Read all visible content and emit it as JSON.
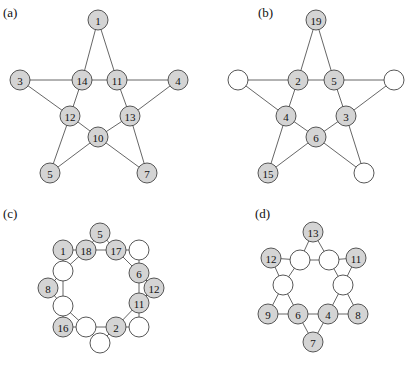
{
  "panels": [
    {
      "id": "a",
      "label": "(a)",
      "label_pos": [
        3,
        17
      ],
      "nodes": [
        {
          "id": "n1",
          "x": 98,
          "y": 20,
          "text": "1",
          "filled": true
        },
        {
          "id": "n3",
          "x": 20,
          "y": 80,
          "text": "3",
          "filled": true
        },
        {
          "id": "n14",
          "x": 82,
          "y": 80,
          "text": "14",
          "filled": true
        },
        {
          "id": "n11",
          "x": 117,
          "y": 80,
          "text": "11",
          "filled": true
        },
        {
          "id": "n4",
          "x": 178,
          "y": 80,
          "text": "4",
          "filled": true
        },
        {
          "id": "n12",
          "x": 70,
          "y": 116,
          "text": "12",
          "filled": true
        },
        {
          "id": "n13",
          "x": 130,
          "y": 116,
          "text": "13",
          "filled": true
        },
        {
          "id": "n10",
          "x": 98,
          "y": 137,
          "text": "10",
          "filled": true
        },
        {
          "id": "n5",
          "x": 50,
          "y": 173,
          "text": "5",
          "filled": true
        },
        {
          "id": "n7",
          "x": 147,
          "y": 173,
          "text": "7",
          "filled": true
        }
      ],
      "edges": [
        [
          "n1",
          "n14"
        ],
        [
          "n1",
          "n11"
        ],
        [
          "n3",
          "n14"
        ],
        [
          "n14",
          "n11"
        ],
        [
          "n11",
          "n4"
        ],
        [
          "n3",
          "n12"
        ],
        [
          "n14",
          "n12"
        ],
        [
          "n11",
          "n13"
        ],
        [
          "n4",
          "n13"
        ],
        [
          "n12",
          "n10"
        ],
        [
          "n13",
          "n10"
        ],
        [
          "n12",
          "n5"
        ],
        [
          "n13",
          "n7"
        ],
        [
          "n10",
          "n5"
        ],
        [
          "n10",
          "n7"
        ]
      ]
    },
    {
      "id": "b",
      "label": "(b)",
      "label_pos": [
        258,
        17
      ],
      "nodes": [
        {
          "id": "n19",
          "x": 316,
          "y": 20,
          "text": "19",
          "filled": true
        },
        {
          "id": "eL",
          "x": 238,
          "y": 80,
          "text": "",
          "filled": false
        },
        {
          "id": "n2",
          "x": 298,
          "y": 80,
          "text": "2",
          "filled": true
        },
        {
          "id": "n5",
          "x": 334,
          "y": 80,
          "text": "5",
          "filled": true
        },
        {
          "id": "eR",
          "x": 394,
          "y": 80,
          "text": "",
          "filled": false
        },
        {
          "id": "n4",
          "x": 286,
          "y": 116,
          "text": "4",
          "filled": true
        },
        {
          "id": "n3",
          "x": 346,
          "y": 116,
          "text": "3",
          "filled": true
        },
        {
          "id": "n6",
          "x": 316,
          "y": 137,
          "text": "6",
          "filled": true
        },
        {
          "id": "n15",
          "x": 268,
          "y": 173,
          "text": "15",
          "filled": true
        },
        {
          "id": "eB",
          "x": 364,
          "y": 173,
          "text": "",
          "filled": false
        }
      ],
      "edges": [
        [
          "n19",
          "n2"
        ],
        [
          "n19",
          "n5"
        ],
        [
          "eL",
          "n2"
        ],
        [
          "n2",
          "n5"
        ],
        [
          "n5",
          "eR"
        ],
        [
          "eL",
          "n4"
        ],
        [
          "n2",
          "n4"
        ],
        [
          "n5",
          "n3"
        ],
        [
          "eR",
          "n3"
        ],
        [
          "n4",
          "n6"
        ],
        [
          "n3",
          "n6"
        ],
        [
          "n4",
          "n15"
        ],
        [
          "n3",
          "eB"
        ],
        [
          "n6",
          "n15"
        ],
        [
          "n6",
          "eB"
        ]
      ]
    },
    {
      "id": "c",
      "label": "(c)",
      "label_pos": [
        3,
        218
      ],
      "nodes": [
        {
          "id": "n5",
          "x": 100,
          "y": 233,
          "text": "5",
          "filled": true
        },
        {
          "id": "n1",
          "x": 63,
          "y": 250,
          "text": "1",
          "filled": true
        },
        {
          "id": "n18",
          "x": 86,
          "y": 250,
          "text": "18",
          "filled": true
        },
        {
          "id": "n17",
          "x": 116,
          "y": 250,
          "text": "17",
          "filled": true
        },
        {
          "id": "eTR",
          "x": 139,
          "y": 250,
          "text": "",
          "filled": false
        },
        {
          "id": "eL1",
          "x": 63,
          "y": 271,
          "text": "",
          "filled": false
        },
        {
          "id": "n6",
          "x": 139,
          "y": 273,
          "text": "6",
          "filled": true
        },
        {
          "id": "n8",
          "x": 48,
          "y": 288,
          "text": "8",
          "filled": true
        },
        {
          "id": "n12",
          "x": 154,
          "y": 288,
          "text": "12",
          "filled": true
        },
        {
          "id": "eL2",
          "x": 63,
          "y": 306,
          "text": "",
          "filled": false
        },
        {
          "id": "n11",
          "x": 139,
          "y": 303,
          "text": "11",
          "filled": true
        },
        {
          "id": "n16",
          "x": 63,
          "y": 327,
          "text": "16",
          "filled": true
        },
        {
          "id": "eB1",
          "x": 86,
          "y": 327,
          "text": "",
          "filled": false
        },
        {
          "id": "n2",
          "x": 116,
          "y": 327,
          "text": "2",
          "filled": true
        },
        {
          "id": "eBR",
          "x": 139,
          "y": 327,
          "text": "",
          "filled": false
        },
        {
          "id": "eB2",
          "x": 100,
          "y": 343,
          "text": "",
          "filled": false
        }
      ],
      "edges": [
        [
          "n5",
          "n18"
        ],
        [
          "n5",
          "n17"
        ],
        [
          "n1",
          "n18"
        ],
        [
          "n18",
          "n17"
        ],
        [
          "n17",
          "eTR"
        ],
        [
          "n1",
          "eL1"
        ],
        [
          "n18",
          "eL1"
        ],
        [
          "n17",
          "n6"
        ],
        [
          "eTR",
          "n6"
        ],
        [
          "eL1",
          "n8"
        ],
        [
          "eL1",
          "eL2"
        ],
        [
          "n8",
          "eL2"
        ],
        [
          "n6",
          "n12"
        ],
        [
          "n6",
          "n11"
        ],
        [
          "n12",
          "n11"
        ],
        [
          "eL2",
          "n16"
        ],
        [
          "eL2",
          "eB1"
        ],
        [
          "n16",
          "eB1"
        ],
        [
          "eB1",
          "n2"
        ],
        [
          "eB1",
          "eB2"
        ],
        [
          "eB2",
          "n2"
        ],
        [
          "n11",
          "n2"
        ],
        [
          "n11",
          "eBR"
        ],
        [
          "n2",
          "eBR"
        ]
      ]
    },
    {
      "id": "d",
      "label": "(d)",
      "label_pos": [
        255,
        218
      ],
      "nodes": [
        {
          "id": "n13",
          "x": 313,
          "y": 232,
          "text": "13",
          "filled": true
        },
        {
          "id": "n12",
          "x": 271,
          "y": 258,
          "text": "12",
          "filled": true
        },
        {
          "id": "eTL",
          "x": 300,
          "y": 260,
          "text": "",
          "filled": false
        },
        {
          "id": "eTR",
          "x": 329,
          "y": 260,
          "text": "",
          "filled": false
        },
        {
          "id": "n11",
          "x": 356,
          "y": 258,
          "text": "11",
          "filled": true
        },
        {
          "id": "eML",
          "x": 283,
          "y": 285,
          "text": "",
          "filled": false
        },
        {
          "id": "eMR",
          "x": 343,
          "y": 285,
          "text": "",
          "filled": false
        },
        {
          "id": "n9",
          "x": 268,
          "y": 314,
          "text": "9",
          "filled": true
        },
        {
          "id": "n6",
          "x": 298,
          "y": 314,
          "text": "6",
          "filled": true
        },
        {
          "id": "n4",
          "x": 328,
          "y": 314,
          "text": "4",
          "filled": true
        },
        {
          "id": "n8",
          "x": 358,
          "y": 314,
          "text": "8",
          "filled": true
        },
        {
          "id": "n7",
          "x": 313,
          "y": 342,
          "text": "7",
          "filled": true
        }
      ],
      "edges": [
        [
          "n13",
          "eTL"
        ],
        [
          "n13",
          "eTR"
        ],
        [
          "n12",
          "eTL"
        ],
        [
          "eTL",
          "eTR"
        ],
        [
          "eTR",
          "n11"
        ],
        [
          "n12",
          "eML"
        ],
        [
          "eTL",
          "eML"
        ],
        [
          "eTR",
          "eMR"
        ],
        [
          "n11",
          "eMR"
        ],
        [
          "eML",
          "n9"
        ],
        [
          "eML",
          "n6"
        ],
        [
          "eMR",
          "n4"
        ],
        [
          "eMR",
          "n8"
        ],
        [
          "n9",
          "n6"
        ],
        [
          "n6",
          "n4"
        ],
        [
          "n4",
          "n8"
        ],
        [
          "n6",
          "n7"
        ],
        [
          "n4",
          "n7"
        ]
      ]
    }
  ],
  "node_radius": 10,
  "colors": {
    "filled": "#d4d4d4",
    "empty": "#ffffff",
    "stroke": "#444444",
    "edge": "#555555"
  }
}
